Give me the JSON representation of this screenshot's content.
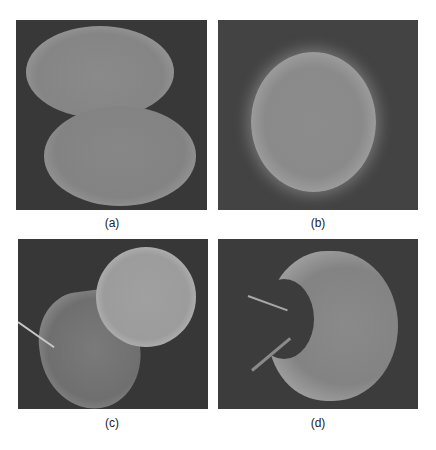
{
  "figure": {
    "panels": [
      {
        "id": "a",
        "label": "(a)",
        "description": "Dividing cell with two lobes (grayscale micrograph)"
      },
      {
        "id": "b",
        "label": "(b)",
        "description": "Single spherical cell (grayscale micrograph)"
      },
      {
        "id": "c",
        "label": "(c)",
        "description": "Spherical cell beside deformed cell with micropipette needle"
      },
      {
        "id": "d",
        "label": "(d)",
        "description": "Deformed cell indented by two needles"
      }
    ]
  }
}
